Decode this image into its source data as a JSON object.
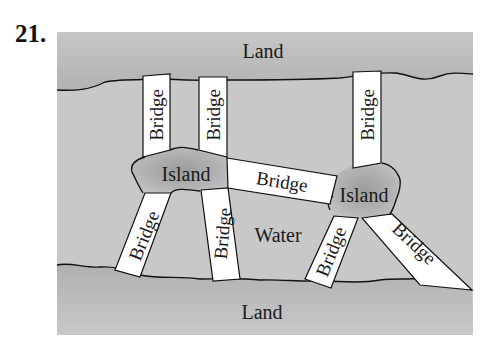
{
  "problem": {
    "number": "21."
  },
  "colors": {
    "water": "#c9c9c9",
    "land": "#bdbdbd",
    "island_center": "#a8a8a8",
    "bridge": "#ffffff",
    "outline": "#111111"
  },
  "regions": {
    "top_land": {
      "label": "Land"
    },
    "bottom_land": {
      "label": "Land"
    },
    "water": {
      "label": "Water"
    },
    "left_island": {
      "label": "Island"
    },
    "right_island": {
      "label": "Island"
    }
  },
  "bridges": [
    {
      "id": "b1",
      "label": "Bridge",
      "connects": [
        "top_land",
        "left_island"
      ]
    },
    {
      "id": "b2",
      "label": "Bridge",
      "connects": [
        "top_land",
        "left_island"
      ]
    },
    {
      "id": "b3",
      "label": "Bridge",
      "connects": [
        "top_land",
        "right_island"
      ]
    },
    {
      "id": "b4",
      "label": "Bridge",
      "connects": [
        "left_island",
        "right_island"
      ]
    },
    {
      "id": "b5",
      "label": "Bridge",
      "connects": [
        "left_island",
        "bottom_land"
      ]
    },
    {
      "id": "b6",
      "label": "Bridge",
      "connects": [
        "left_island",
        "bottom_land"
      ]
    },
    {
      "id": "b7",
      "label": "Bridge",
      "connects": [
        "right_island",
        "bottom_land"
      ]
    },
    {
      "id": "b8",
      "label": "Bridge",
      "connects": [
        "right_island",
        "bottom_land"
      ]
    }
  ]
}
